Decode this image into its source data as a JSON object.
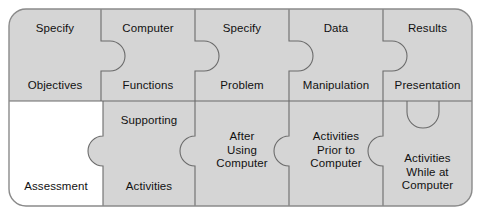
{
  "diagram": {
    "colors": {
      "piece_fill": "#d5d5d5",
      "highlight_fill": "#ffffff",
      "stroke": "#6b6b6b",
      "outer_stroke": "#8a8a8a",
      "text": "#111111",
      "background": "#ffffff"
    },
    "rows": [
      {
        "name": "top-row",
        "pieces": [
          {
            "id": "specify-objectives",
            "top_label": "Specify",
            "bottom_label": "Objectives",
            "fill": "piece_fill"
          },
          {
            "id": "computer-functions",
            "top_label": "Computer",
            "bottom_label": "Functions",
            "fill": "piece_fill"
          },
          {
            "id": "specify-problem",
            "top_label": "Specify",
            "bottom_label": "Problem",
            "fill": "piece_fill"
          },
          {
            "id": "data-manipulation",
            "top_label": "Data",
            "bottom_label": "Manipulation",
            "fill": "piece_fill"
          },
          {
            "id": "results-presentation",
            "top_label": "Results",
            "bottom_label": "Presentation",
            "fill": "piece_fill"
          }
        ]
      },
      {
        "name": "bottom-row",
        "pieces": [
          {
            "id": "assessment",
            "top_label": "",
            "bottom_label": "Assessment",
            "center_label": "",
            "fill": "highlight_fill"
          },
          {
            "id": "supporting-activities",
            "top_label": "Supporting",
            "bottom_label": "Activities",
            "center_label": "",
            "fill": "piece_fill"
          },
          {
            "id": "after-using-computer",
            "top_label": "",
            "bottom_label": "",
            "center_label": "After\nUsing\nComputer",
            "fill": "piece_fill"
          },
          {
            "id": "activities-prior",
            "top_label": "",
            "bottom_label": "",
            "center_label": "Activities\nPrior to\nComputer",
            "fill": "piece_fill"
          },
          {
            "id": "activities-while-at",
            "top_label": "",
            "bottom_label": "",
            "center_label": "Activities\nWhile at\nComputer",
            "fill": "piece_fill"
          }
        ]
      }
    ]
  }
}
